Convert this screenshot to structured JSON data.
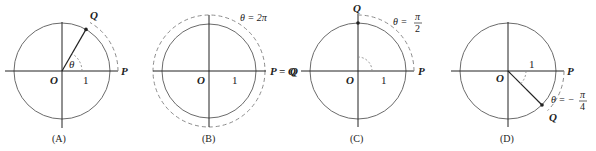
{
  "figure": {
    "colors": {
      "ink": "#222222",
      "circle": "#6b6b6b",
      "dash": "#8c8c8c"
    },
    "panels": [
      {
        "id": "A",
        "caption": "(A)",
        "origin": "O",
        "unit": "1",
        "start_point": "P",
        "end_point": "Q",
        "angle_label": "θ",
        "angle_deg": 60
      },
      {
        "id": "B",
        "caption": "(B)",
        "origin": "O",
        "unit": "1",
        "start_point": "P = Q",
        "angle_label": "θ = 2π",
        "angle_deg": 360
      },
      {
        "id": "C",
        "caption": "(C)",
        "origin": "O",
        "unit": "1",
        "start_point": "P",
        "end_point": "Q",
        "left_point": "Q",
        "angle_label": "θ =",
        "angle_num": "π",
        "angle_den": "2",
        "angle_deg": 90
      },
      {
        "id": "D",
        "caption": "(D)",
        "origin": "O",
        "unit": "1",
        "start_point": "P",
        "end_point": "Q",
        "angle_label": "θ = −",
        "angle_num": "π",
        "angle_den": "4",
        "angle_deg": -45
      }
    ]
  }
}
